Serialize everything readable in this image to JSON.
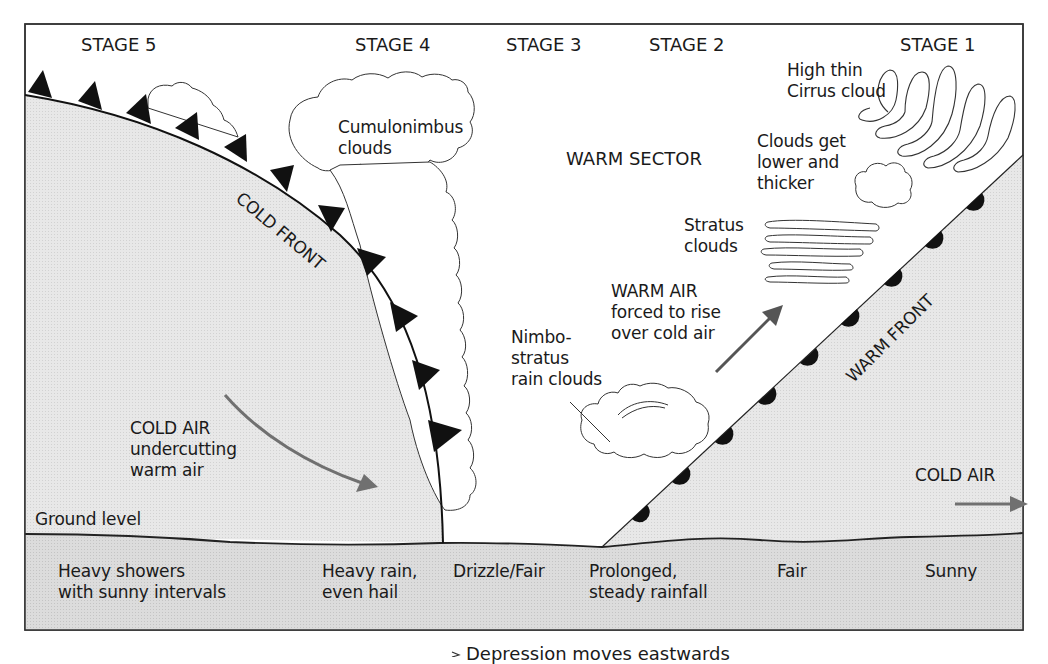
{
  "stages": [
    {
      "label": "STAGE 5"
    },
    {
      "label": "STAGE 4"
    },
    {
      "label": "STAGE 3"
    },
    {
      "label": "STAGE 2"
    },
    {
      "label": "STAGE 1"
    }
  ],
  "fronts": {
    "cold_front": "COLD FRONT",
    "warm_front": "WARM FRONT"
  },
  "clouds": {
    "cumulonimbus": [
      "Cumulonimbus",
      "clouds"
    ],
    "cirrus": [
      "High thin",
      "Cirrus cloud"
    ],
    "lower_thicker": [
      "Clouds get",
      "lower and",
      "thicker"
    ],
    "stratus": [
      "Stratus",
      "clouds"
    ],
    "nimbostratus": [
      "Nimbo-",
      "stratus",
      "rain clouds"
    ]
  },
  "sectors": {
    "warm_sector": "WARM SECTOR",
    "warm_air": [
      "WARM AIR",
      "forced to rise",
      "over cold air"
    ],
    "cold_air_left": [
      "COLD AIR",
      "undercutting",
      "warm air"
    ],
    "cold_air_right": "COLD AIR"
  },
  "ground": {
    "label": "Ground level",
    "weather": [
      {
        "stage": "STAGE 5",
        "lines": [
          "Heavy showers",
          "with sunny intervals"
        ]
      },
      {
        "stage": "STAGE 4",
        "lines": [
          "Heavy rain,",
          "even hail"
        ]
      },
      {
        "stage": "STAGE 3",
        "lines": [
          "Drizzle/Fair"
        ]
      },
      {
        "stage": "STAGE 2",
        "lines": [
          "Prolonged,",
          "steady rainfall"
        ]
      },
      {
        "stage": "STAGE 1a",
        "lines": [
          "Fair"
        ]
      },
      {
        "stage": "STAGE 1",
        "lines": [
          "Sunny"
        ]
      }
    ]
  },
  "caption": "Depression moves eastwards",
  "colors": {
    "cold_air_fill": "#e6e6e6",
    "ground_fill": "#d9d9d9",
    "arrow": "#707070",
    "front_symbol": "#111111",
    "outline": "#222222"
  }
}
